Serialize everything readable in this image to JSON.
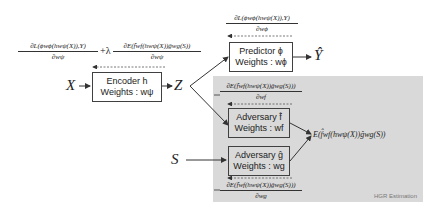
{
  "diagram": {
    "variables": {
      "x": "X",
      "z": "Z",
      "s": "S",
      "y_hat": "Ŷ",
      "expectation": "E(f̂wf(hwψ(X))ĝwg(S))"
    },
    "boxes": {
      "encoder": {
        "title": "Encoder h",
        "weights": "Weights : wψ"
      },
      "predictor": {
        "title": "Predictor ϕ",
        "weights": "Weights : wϕ"
      },
      "adversary_f": {
        "title": "Adversary f̂",
        "weights": "Weights : wf"
      },
      "adversary_g": {
        "title": "Adversary ĝ",
        "weights": "Weights : wg"
      }
    },
    "gradients": {
      "encoder": {
        "term1_num": "∂L(ϕwϕ(hwψ(X)),Y)",
        "term1_den": "∂wψ",
        "plus_lambda": "+λ",
        "term2_num": "∂E(f̂wf(hwψ(X))ĝwg(S))",
        "term2_den": "∂wψ"
      },
      "predictor": {
        "num": "∂L(ϕwϕ(hwψ(X)),Y)",
        "den": "∂wϕ"
      },
      "adversary_f": {
        "num": "∂E(f̂wf(hwψ(X))ĝwg(S)))",
        "den": "∂wf"
      },
      "adversary_g": {
        "num": "∂E(f̂wf(hwψ(X))ĝwg(S)))",
        "den": "∂wg"
      }
    },
    "region_label": "HGR Estimation",
    "colors": {
      "region_bg": "#d9d9d9",
      "box_border": "#404040",
      "arrow": "#333333"
    }
  }
}
